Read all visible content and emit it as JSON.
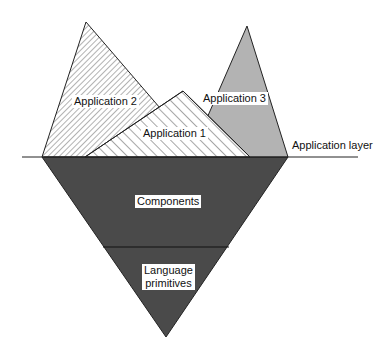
{
  "diagram": {
    "applications": [
      {
        "label": "Application 2",
        "fill": "hatch-forward"
      },
      {
        "label": "Application 1",
        "fill": "hatch-backward"
      },
      {
        "label": "Application 3",
        "fill": "#b3b3b3"
      }
    ],
    "layer_label": "Application layer",
    "base": {
      "components_label": "Components",
      "primitives_label_line1": "Language",
      "primitives_label_line2": "primitives",
      "fill": "#4a4a4a"
    }
  }
}
